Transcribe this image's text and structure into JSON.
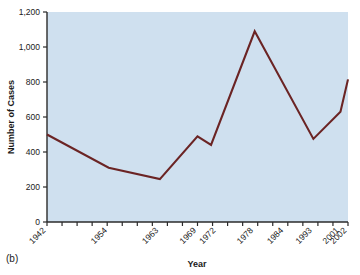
{
  "figure": {
    "panel_label": "(b)",
    "background_color": "#ffffff"
  },
  "chart_data": {
    "type": "line",
    "title": "",
    "xlabel": "Year",
    "ylabel": "Number of Cases",
    "plot_background_color": "#cfe0ef",
    "line_color": "#6b2424",
    "grid": false,
    "legend": "none",
    "ylim": [
      0,
      1200
    ],
    "y_ticks": [
      0,
      200,
      400,
      600,
      800,
      1000,
      1200
    ],
    "y_tick_labels": [
      "0",
      "200",
      "400",
      "600",
      "800",
      "1,000",
      "1,200"
    ],
    "x_tick_labels": [
      "1942",
      "1954",
      "1963",
      "1969",
      "1972",
      "1978",
      "1984",
      "1993",
      "2001",
      "2002"
    ],
    "x_tick_count": 21,
    "x": [
      "1942",
      "1954",
      "1963",
      "1969",
      "1971",
      "1978",
      "1993",
      "2001",
      "2002"
    ],
    "values": [
      500,
      310,
      245,
      490,
      440,
      1090,
      475,
      630,
      815
    ],
    "points": [
      {
        "x": "1942",
        "y": 500
      },
      {
        "x": "1954",
        "y": 310
      },
      {
        "x": "1963",
        "y": 245
      },
      {
        "x": "1969",
        "y": 490
      },
      {
        "x": "1971",
        "y": 440
      },
      {
        "x": "1978",
        "y": 1090
      },
      {
        "x": "1993",
        "y": 475
      },
      {
        "x": "2001",
        "y": 630
      },
      {
        "x": "2002",
        "y": 815
      }
    ]
  }
}
